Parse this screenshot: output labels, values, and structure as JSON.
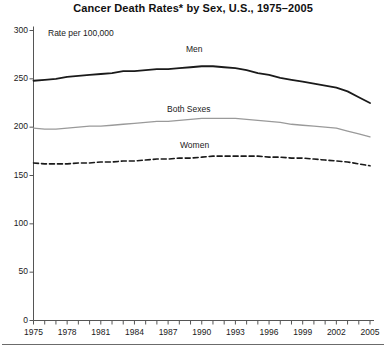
{
  "chart_data": {
    "type": "line",
    "title": "Cancer Death Rates* by Sex, U.S., 1975–2005",
    "subtitle": "Rate per 100,000",
    "xlabel": "",
    "ylabel": "Rate per 100,000",
    "ylim": [
      0,
      300
    ],
    "xlim": [
      1975,
      2005
    ],
    "grid": false,
    "legend_position": "inline-labels",
    "y_ticks": [
      0,
      50,
      100,
      150,
      200,
      250,
      300
    ],
    "y_tick_labels": [
      "0",
      "50",
      "100",
      "150",
      "200",
      "250",
      "300"
    ],
    "x_ticks": [
      1975,
      1976,
      1977,
      1978,
      1979,
      1980,
      1981,
      1982,
      1983,
      1984,
      1985,
      1986,
      1987,
      1988,
      1989,
      1990,
      1991,
      1992,
      1993,
      1994,
      1995,
      1996,
      1997,
      1998,
      1999,
      2000,
      2001,
      2002,
      2003,
      2004,
      2005
    ],
    "x_tick_labels": [
      "1975",
      "1978",
      "1981",
      "1984",
      "1987",
      "1990",
      "1993",
      "1996",
      "1999",
      "2002",
      "2005"
    ],
    "x_tick_label_years": [
      1975,
      1978,
      1981,
      1984,
      1987,
      1990,
      1993,
      1996,
      1999,
      2002,
      2005
    ],
    "x": [
      1975,
      1976,
      1977,
      1978,
      1979,
      1980,
      1981,
      1982,
      1983,
      1984,
      1985,
      1986,
      1987,
      1988,
      1989,
      1990,
      1991,
      1992,
      1993,
      1994,
      1995,
      1996,
      1997,
      1998,
      1999,
      2000,
      2001,
      2002,
      2003,
      2004,
      2005
    ],
    "series": [
      {
        "name": "Men",
        "style": "solid",
        "color": "#1a1a1a",
        "width": 1.8,
        "label_text": "Men",
        "values": [
          248,
          249,
          250,
          252,
          253,
          254,
          255,
          256,
          258,
          258,
          259,
          260,
          260,
          261,
          262,
          263,
          263,
          262,
          261,
          259,
          256,
          254,
          251,
          249,
          247,
          245,
          243,
          241,
          237,
          231,
          225
        ]
      },
      {
        "name": "Both Sexes",
        "style": "solid",
        "color": "#9a9a9a",
        "width": 1.3,
        "label_text": "Both Sexes",
        "values": [
          199,
          198,
          198,
          199,
          200,
          201,
          201,
          202,
          203,
          204,
          205,
          206,
          206,
          207,
          208,
          209,
          209,
          209,
          209,
          208,
          207,
          206,
          205,
          203,
          202,
          201,
          200,
          199,
          196,
          193,
          190
        ]
      },
      {
        "name": "Women",
        "style": "dashed",
        "color": "#1a1a1a",
        "width": 1.6,
        "label_text": "Women",
        "values": [
          163,
          162,
          162,
          162,
          163,
          163,
          164,
          164,
          165,
          165,
          166,
          167,
          167,
          168,
          168,
          169,
          170,
          170,
          170,
          170,
          170,
          169,
          169,
          168,
          168,
          167,
          166,
          165,
          164,
          162,
          160
        ]
      }
    ],
    "footnote_marker": "*"
  },
  "axis": {
    "y_label_note": "Rate per 100,000"
  }
}
